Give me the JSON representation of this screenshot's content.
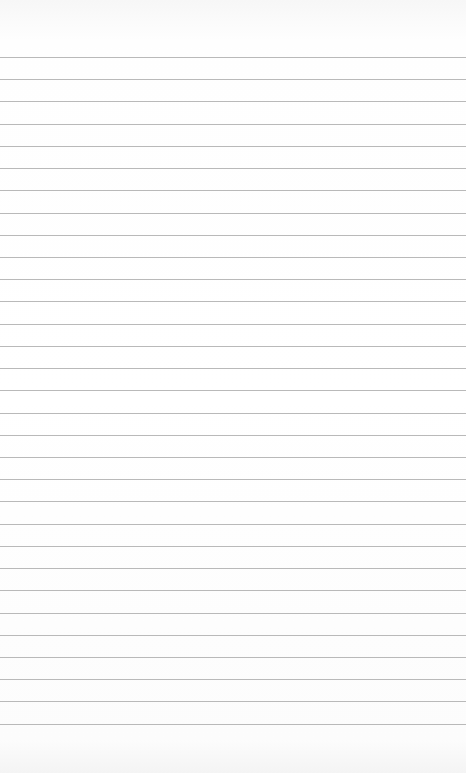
{
  "paper": {
    "type": "lined-notebook-page",
    "line_color": "#b9b9b9",
    "background_color": "#fdfdfd",
    "line_count": 31,
    "first_line_y": 57,
    "line_spacing": 22.22,
    "text": ""
  }
}
